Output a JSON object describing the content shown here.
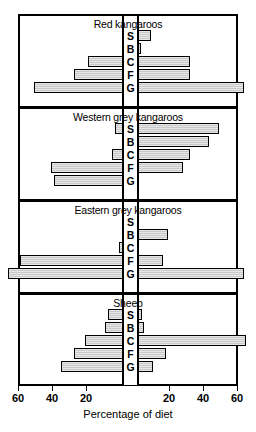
{
  "chart_data": {
    "type": "bar",
    "orientation": "horizontal-diverging",
    "title": "",
    "xlabel": "Percentage of diet",
    "ylabel": "",
    "categories": [
      "S",
      "B",
      "C",
      "F",
      "G"
    ],
    "category_names": [
      "S",
      "B",
      "C",
      "F",
      "G"
    ],
    "xlim": [
      -75,
      75
    ],
    "xticks": [
      -60,
      -40,
      -20,
      20,
      40,
      60
    ],
    "xticklabels": [
      "60",
      "40",
      "20",
      "20",
      "40",
      "60"
    ],
    "grid": false,
    "legend": "none",
    "note": "Each panel is a back-to-back (diverging) bar chart; left side and right side are separate magnitudes in percentage of diet.",
    "panels": [
      {
        "title": "Red kangaroos",
        "categories": [
          "S",
          "B",
          "C",
          "F",
          "G"
        ],
        "left": [
          0,
          0,
          20,
          28,
          52
        ],
        "right": [
          7,
          1,
          30,
          30,
          62
        ]
      },
      {
        "title": "Western grey kangaroos",
        "categories": [
          "S",
          "B",
          "C",
          "F",
          "G"
        ],
        "left": [
          4,
          0,
          6,
          42,
          40
        ],
        "right": [
          47,
          41,
          30,
          26,
          0
        ]
      },
      {
        "title": "Eastern grey kangaroos",
        "categories": [
          "S",
          "B",
          "C",
          "F",
          "G"
        ],
        "left": [
          0,
          0,
          2,
          60,
          67
        ],
        "right": [
          0,
          17,
          0,
          14,
          62
        ]
      },
      {
        "title": "Sheep",
        "categories": [
          "S",
          "B",
          "C",
          "F",
          "G"
        ],
        "left": [
          8,
          10,
          22,
          28,
          36
        ],
        "right": [
          2,
          3,
          63,
          16,
          8
        ]
      }
    ]
  },
  "axis": {
    "title": "Percentage of diet",
    "ticks": [
      {
        "label": "60",
        "value": -60
      },
      {
        "label": "40",
        "value": -40
      },
      {
        "label": "20",
        "value": -20
      },
      {
        "label": "20",
        "value": 20
      },
      {
        "label": "40",
        "value": 40
      },
      {
        "label": "60",
        "value": 60
      }
    ]
  },
  "panels": [
    {
      "title": "Red kangaroos"
    },
    {
      "title": "Western grey kangaroos"
    },
    {
      "title": "Eastern grey kangaroos"
    },
    {
      "title": "Sheep"
    }
  ],
  "style": {
    "bar_fill": "#c9c9c9",
    "bar_stroke": "#000000",
    "frame": "#000000",
    "background": "#ffffff"
  }
}
